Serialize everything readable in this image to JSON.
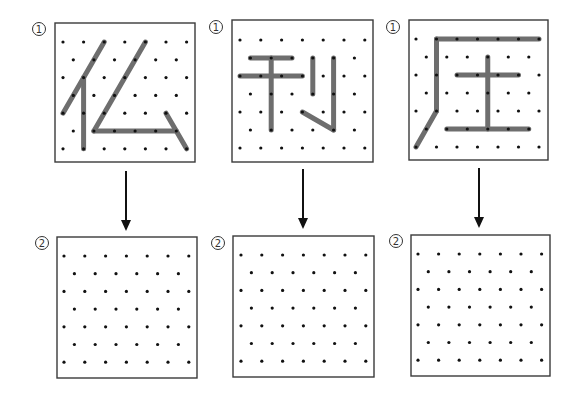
{
  "figure": {
    "width": 578,
    "height": 397,
    "background": "#ffffff",
    "dot_color": "#111111",
    "stroke_color": "#6e6e6e",
    "border_color": "#3a3a3a",
    "grid_layout": {
      "rows": 7,
      "full_row_dots": 7,
      "offset_row_dots": 6,
      "pattern": "staggered triangular lattice (even rows 7 dots, odd rows 6 dots offset by half spacing)"
    }
  },
  "panels": [
    {
      "id": "panel-1",
      "character": "仫",
      "components": [
        "亻",
        "厶"
      ],
      "top": {
        "label": "①",
        "label_pos": [
          39,
          29
        ],
        "box": [
          55,
          23,
          140,
          139
        ],
        "origin": [
          63,
          42
        ],
        "dx": 20.6,
        "dy": 17.8,
        "strokes": [
          [
            [
              2,
              0
            ],
            [
              0,
              4
            ]
          ],
          [
            [
              1,
              2
            ],
            [
              1,
              6
            ]
          ],
          [
            [
              4,
              0
            ],
            [
              1,
              5
            ]
          ],
          [
            [
              1,
              5
            ],
            [
              5,
              5
            ]
          ],
          [
            [
              5,
              4
            ],
            [
              6,
              6
            ]
          ]
        ]
      },
      "arrow": {
        "x": 126,
        "y1": 171,
        "y2": 231
      },
      "bottom": {
        "label": "②",
        "label_pos": [
          42,
          243
        ],
        "box": [
          57,
          237,
          140,
          141
        ],
        "origin": [
          64,
          256
        ],
        "dx": 20.8,
        "dy": 17.7,
        "strokes": []
      }
    },
    {
      "id": "panel-2",
      "character": "刊",
      "components": [
        "干",
        "刂"
      ],
      "top": {
        "label": "①",
        "label_pos": [
          216,
          27
        ],
        "box": [
          232,
          20,
          141,
          142
        ],
        "origin": [
          240,
          40
        ],
        "dx": 20.8,
        "dy": 18,
        "strokes": [
          [
            [
              0,
              1
            ],
            [
              2,
              1
            ]
          ],
          [
            [
              0,
              2
            ],
            [
              3,
              2
            ]
          ],
          [
            [
              1,
              1
            ],
            [
              1,
              5
            ]
          ],
          [
            [
              3,
              1
            ],
            [
              3,
              3
            ]
          ],
          [
            [
              4,
              1
            ],
            [
              4,
              5
            ]
          ],
          [
            [
              3,
              4
            ],
            [
              4,
              5
            ]
          ]
        ]
      },
      "arrow": {
        "x": 303,
        "y1": 169,
        "y2": 229
      },
      "bottom": {
        "label": "②",
        "label_pos": [
          218,
          243
        ],
        "box": [
          233,
          236,
          141,
          141
        ],
        "origin": [
          241,
          255
        ],
        "dx": 20.8,
        "dy": 17.7,
        "strokes": []
      }
    },
    {
      "id": "panel-3",
      "character": "庄",
      "components": [
        "广",
        "土"
      ],
      "top": {
        "label": "①",
        "label_pos": [
          393,
          27
        ],
        "box": [
          409,
          20,
          139,
          140
        ],
        "origin": [
          416,
          39
        ],
        "dx": 20.5,
        "dy": 18,
        "strokes": [
          [
            [
              1,
              0
            ],
            [
              6,
              0
            ]
          ],
          [
            [
              1,
              0
            ],
            [
              1,
              4
            ]
          ],
          [
            [
              1,
              4
            ],
            [
              0,
              6
            ]
          ],
          [
            [
              2,
              2
            ],
            [
              5,
              2
            ]
          ],
          [
            [
              3,
              1
            ],
            [
              3,
              5
            ]
          ],
          [
            [
              1,
              5
            ],
            [
              5,
              5
            ]
          ]
        ]
      },
      "arrow": {
        "x": 479,
        "y1": 168,
        "y2": 228
      },
      "bottom": {
        "label": "②",
        "label_pos": [
          396,
          241
        ],
        "box": [
          411,
          235,
          139,
          141
        ],
        "origin": [
          418,
          254
        ],
        "dx": 20.6,
        "dy": 17.7,
        "strokes": []
      }
    }
  ]
}
